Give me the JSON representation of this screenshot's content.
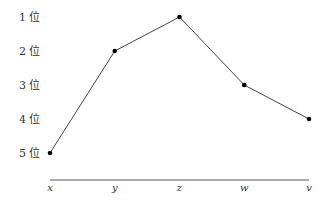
{
  "chart_data": {
    "type": "line",
    "title": "",
    "xlabel": "",
    "ylabel": "",
    "categories": [
      "x",
      "y",
      "z",
      "w",
      "v"
    ],
    "values": [
      5,
      2,
      1,
      3,
      4
    ],
    "y_tick_labels": [
      "1 位",
      "2 位",
      "3 位",
      "4 位",
      "5 位"
    ],
    "y_ticks": [
      1,
      2,
      3,
      4,
      5
    ],
    "ylim": [
      1,
      5
    ],
    "y_inverted": true,
    "grid": false,
    "legend": null,
    "colors": {
      "line": "#444444",
      "marker": "#000000",
      "axis": "#555555",
      "text": "#333333"
    }
  }
}
